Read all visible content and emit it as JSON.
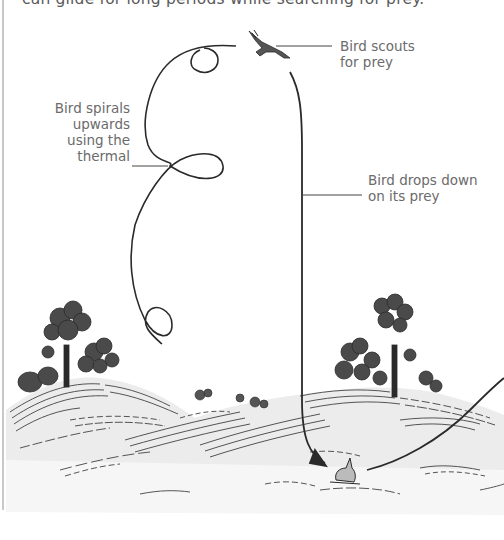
{
  "caption": {
    "text": "can glide for long periods while searching for prey."
  },
  "labels": {
    "scouts": {
      "line1": "Bird scouts",
      "line2": "for prey"
    },
    "spirals": {
      "line1": "Bird spirals",
      "line2": "upwards",
      "line3": "using the",
      "line4": "thermal"
    },
    "drops": {
      "line1": "Bird drops down",
      "line2": "on its prey"
    }
  },
  "illustration": {
    "elements": [
      "bird-in-flight",
      "spiral-flight-path",
      "drop-path-arrow",
      "rabbit-prey",
      "hills",
      "trees",
      "bushes"
    ],
    "ink_color": "#2a2a2a",
    "label_color": "#6b6b6b",
    "hill_fill": "#ececec"
  }
}
